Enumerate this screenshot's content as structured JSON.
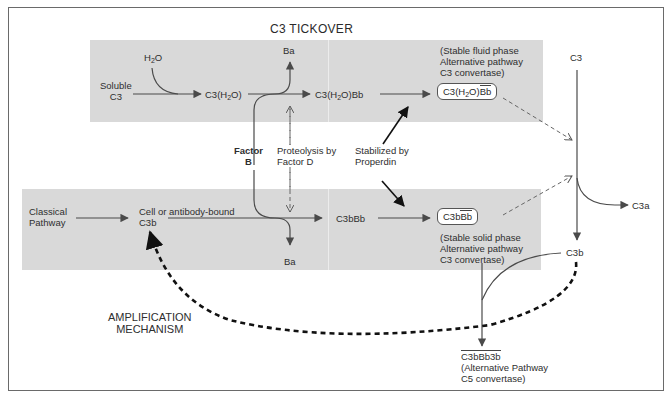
{
  "diagram": {
    "title": "C3 TICKOVER",
    "amplification_label": [
      "AMPLIFICATION",
      "MECHANISM"
    ],
    "top_row": {
      "h2o": "H2O",
      "soluble_c3": [
        "Soluble",
        "C3"
      ],
      "c3h2o": "C3(H2O)",
      "ba_top": "Ba",
      "c3h2obb": "C3(H2O)Bb",
      "fluid_phase_note": [
        "(Stable fluid phase",
        "Alternative pathway",
        "C3 convertase)"
      ],
      "fluid_convertase": "C3(H2O)Bb"
    },
    "middle": {
      "factor_b": [
        "Factor",
        "B"
      ],
      "proteolysis": [
        "Proteolysis by",
        "Factor D"
      ],
      "stabilized": [
        "Stabilized by",
        "Properdin"
      ]
    },
    "bottom_row": {
      "classical_pathway": [
        "Classical",
        "Pathway"
      ],
      "cell_bound": [
        "Cell or antibody-bound",
        "C3b"
      ],
      "ba_bottom": "Ba",
      "c3bbb": "C3bBb",
      "solid_convertase": "C3bBb",
      "solid_phase_note": [
        "(Stable solid phase",
        "Alternative pathway",
        "C3 convertase)"
      ]
    },
    "right_column": {
      "c3": "C3",
      "c3a": "C3a",
      "c3b": "C3b"
    },
    "c5_convertase": {
      "name": "C3bBb3b",
      "note": [
        "(Alternative Pathway",
        "C5 convertase)"
      ]
    },
    "colors": {
      "panel": "#d9d9d9",
      "line": "#555555",
      "dark_arrow": "#1a1a1a",
      "frame": "#6a6a6a"
    }
  }
}
